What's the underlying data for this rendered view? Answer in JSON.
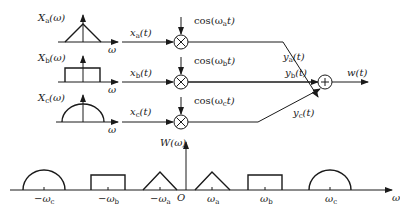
{
  "diagram": {
    "type": "block-diagram",
    "input_spectra": [
      {
        "label": "X_a(ω)",
        "shape": "triangle",
        "axis_label": "ω"
      },
      {
        "label": "X_b(ω)",
        "shape": "rectangle",
        "axis_label": "ω"
      },
      {
        "label": "X_c(ω)",
        "shape": "semicircle",
        "axis_label": "ω"
      }
    ],
    "branches": [
      {
        "input": "x_a(t)",
        "carrier": "cos(ω_a t)",
        "output": "y_a(t)"
      },
      {
        "input": "x_b(t)",
        "carrier": "cos(ω_b t)",
        "output": "y_b(t)"
      },
      {
        "input": "x_c(t)",
        "carrier": "cos(ω_c t)",
        "output": "y_c(t)"
      }
    ],
    "multiplier_symbol": "×",
    "adder_symbol": "+",
    "output": "w(t)",
    "output_spectrum": {
      "label": "W(ω)",
      "origin_label": "O",
      "axis_label": "ω",
      "ticks": [
        "−ω_c",
        "−ω_b",
        "−ω_a",
        "ω_a",
        "ω_b",
        "ω_c"
      ],
      "shapes": [
        "semicircle",
        "rectangle",
        "triangle",
        "triangle",
        "rectangle",
        "semicircle"
      ]
    }
  },
  "text": {
    "Xa": "X",
    "Xa_sub": "a",
    "Xa_arg": "(ω)",
    "Xb": "X",
    "Xb_sub": "b",
    "Xb_arg": "(ω)",
    "Xc": "X",
    "Xc_sub": "c",
    "Xc_arg": "(ω)",
    "omega": "ω",
    "xa": "x",
    "xa_sub": "a",
    "xa_arg": "(t)",
    "xb": "x",
    "xb_sub": "b",
    "xb_arg": "(t)",
    "xc": "x",
    "xc_sub": "c",
    "xc_arg": "(t)",
    "cos_a_pre": "cos(ω",
    "cos_a_sub": "a",
    "cos_a_post": "t)",
    "cos_b_pre": "cos(ω",
    "cos_b_sub": "b",
    "cos_b_post": "t)",
    "cos_c_pre": "cos(ω",
    "cos_c_sub": "c",
    "cos_c_post": "t)",
    "ya": "y",
    "ya_sub": "a",
    "ya_arg": "(t)",
    "yb": "y",
    "yb_sub": "b",
    "yb_arg": "(t)",
    "yc": "y",
    "yc_sub": "c",
    "yc_arg": "(t)",
    "w": "w(t)",
    "W": "W(ω)",
    "O": "O",
    "times": "×",
    "plus": "+",
    "minus": "−",
    "sub_a": "a",
    "sub_b": "b",
    "sub_c": "c"
  }
}
